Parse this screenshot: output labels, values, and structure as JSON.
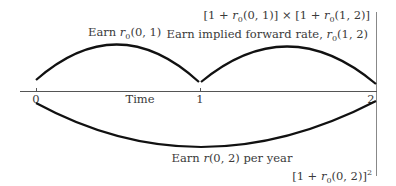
{
  "diagram": {
    "axis": {
      "label": "Time",
      "ticks": [
        "0",
        "1",
        "2"
      ]
    },
    "upper_arcs": [
      {
        "from": "0",
        "to": "1",
        "label_prefix": "Earn ",
        "label_var": "r",
        "label_sub": "0",
        "label_suffix": "(0, 1)"
      },
      {
        "from": "1",
        "to": "2",
        "label_prefix": "Earn implied forward rate, ",
        "label_var": "r",
        "label_sub": "0",
        "label_suffix": "(1, 2)"
      }
    ],
    "lower_arc": {
      "from": "0",
      "to": "2",
      "label_prefix": "Earn ",
      "label_var": "r",
      "label_suffix": "(0, 2) per year"
    },
    "top_result": {
      "part1_a": "[1 + ",
      "part1_var": "r",
      "part1_sub": "0",
      "part1_b": "(0, 1)] × [1 + ",
      "part2_var": "r",
      "part2_sub": "0",
      "part2_b": "(1, 2)]"
    },
    "bottom_result": {
      "a": "[1 + ",
      "var": "r",
      "sub": "0",
      "b": "(0, 2)]",
      "sup": "2"
    },
    "colors": {
      "curve": "#111111",
      "axis": "#555555",
      "text": "#3a3a3a",
      "divider": "#888888"
    }
  }
}
